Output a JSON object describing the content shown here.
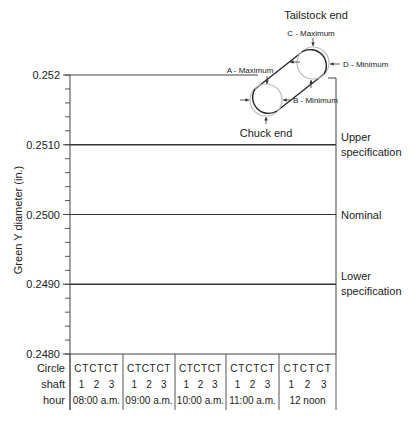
{
  "chart_data": {
    "type": "line",
    "title": "",
    "xlabel": "",
    "ylabel": "Green Y diameter (in.)",
    "ylim": [
      0.248,
      0.252
    ],
    "y_ticks": [
      "0.252",
      "0.2510",
      "0.2500",
      "0.2490",
      "0.2480"
    ],
    "y_tick_values": [
      0.252,
      0.251,
      0.25,
      0.249,
      0.248
    ],
    "minor_tick_step": 0.0002,
    "reference_lines": [
      {
        "name": "Upper specification",
        "value": 0.251,
        "label_line1": "Upper",
        "label_line2": "specification"
      },
      {
        "name": "Nominal",
        "value": 0.25,
        "label_line1": "Nominal",
        "label_line2": ""
      },
      {
        "name": "Lower specification",
        "value": 0.249,
        "label_line1": "Lower",
        "label_line2": "specification"
      }
    ],
    "series": [],
    "grid": false,
    "x_table": {
      "row_labels": [
        "Circle",
        "shaft",
        "hour"
      ],
      "groups": [
        {
          "hour": "08:00 a.m.",
          "shafts": [
            "1",
            "2",
            "3"
          ],
          "circles": [
            "C",
            "T",
            "C",
            "T",
            "C",
            "T"
          ]
        },
        {
          "hour": "09:00 a.m.",
          "shafts": [
            "1",
            "2",
            "3"
          ],
          "circles": [
            "C",
            "T",
            "C",
            "T",
            "C",
            "T"
          ]
        },
        {
          "hour": "10:00 a.m.",
          "shafts": [
            "1",
            "2",
            "3"
          ],
          "circles": [
            "C",
            "T",
            "C",
            "T",
            "C",
            "T"
          ]
        },
        {
          "hour": "11:00 a.m.",
          "shafts": [
            "1",
            "2",
            "3"
          ],
          "circles": [
            "C",
            "T",
            "C",
            "T",
            "C",
            "T"
          ]
        },
        {
          "hour": "12 noon",
          "shafts": [
            "1",
            "2",
            "3"
          ],
          "circles": [
            "C",
            "T",
            "C",
            "T",
            "C",
            "T"
          ]
        }
      ]
    }
  },
  "diagram": {
    "tailstock_label": "Tailstock end",
    "chuck_label": "Chuck end",
    "point_a": "A - Maximum",
    "point_b": "B - Minimum",
    "point_c": "C - Maximum",
    "point_d": "D - Minimum"
  }
}
